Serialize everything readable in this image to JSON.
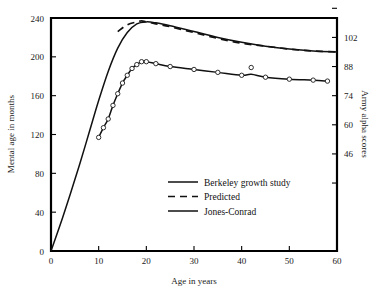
{
  "chart_data": {
    "type": "line",
    "title": "",
    "xlabel": "Age in years",
    "ylabel": "Mental age in months",
    "y2label": "Army alpha scores",
    "xlim": [
      0,
      60
    ],
    "ylim": [
      0,
      240
    ],
    "y2lim": [
      46,
      102
    ],
    "grid": false,
    "legend_position": "center",
    "xticks": [
      0,
      10,
      20,
      30,
      40,
      50,
      60
    ],
    "xtick_labels": [
      "0",
      "10",
      "20",
      "30",
      "40",
      "50",
      "60"
    ],
    "yticks": [
      0,
      40,
      80,
      120,
      160,
      200,
      240
    ],
    "ytick_labels": [
      "0",
      "40",
      "80",
      "120",
      "160",
      "200",
      "240"
    ],
    "y2ticks": [
      46,
      60,
      74,
      88,
      102
    ],
    "y2tick_labels": [
      "46",
      "60",
      "74",
      "88",
      "102"
    ],
    "y2tick_months": [
      100,
      130,
      160,
      190,
      220
    ],
    "series": [
      {
        "name": "Berkeley growth study",
        "style": "solid",
        "marker": "none",
        "x": [
          0,
          2,
          4,
          6,
          8,
          10,
          12,
          14,
          16,
          18,
          20,
          22,
          25,
          30,
          35,
          40,
          45,
          50,
          55,
          60
        ],
        "y": [
          0,
          28,
          58,
          89,
          122,
          155,
          185,
          209,
          225,
          234,
          236,
          235,
          232,
          226,
          220,
          215,
          211,
          208,
          206,
          205
        ]
      },
      {
        "name": "Predicted",
        "style": "dashed",
        "marker": "none",
        "x": [
          14,
          16,
          18,
          19,
          20,
          22,
          25,
          30,
          35,
          40,
          45,
          50,
          55,
          60
        ],
        "y": [
          226,
          233,
          236,
          237,
          236,
          234,
          231,
          225,
          219,
          214,
          211,
          208,
          206,
          205
        ]
      },
      {
        "name": "Jones-Conrad",
        "style": "solid",
        "marker": "circle",
        "x": [
          10,
          11,
          12,
          13,
          14,
          15,
          16,
          17,
          18,
          19,
          20,
          22,
          25,
          30,
          35,
          40,
          42,
          45,
          50,
          55,
          58
        ],
        "y": [
          117,
          127,
          136,
          150,
          162,
          173,
          181,
          188,
          192,
          195,
          195,
          193,
          190,
          187,
          184,
          181,
          182,
          179,
          177,
          176,
          175
        ]
      }
    ],
    "data_points": [
      {
        "age": 10,
        "mental_age": 117
      },
      {
        "age": 11,
        "mental_age": 127
      },
      {
        "age": 12,
        "mental_age": 136
      },
      {
        "age": 13,
        "mental_age": 150
      },
      {
        "age": 14,
        "mental_age": 162
      },
      {
        "age": 15,
        "mental_age": 173
      },
      {
        "age": 16,
        "mental_age": 181
      },
      {
        "age": 17,
        "mental_age": 188
      },
      {
        "age": 18,
        "mental_age": 192
      },
      {
        "age": 19,
        "mental_age": 195
      },
      {
        "age": 20,
        "mental_age": 195
      },
      {
        "age": 22,
        "mental_age": 193
      },
      {
        "age": 25,
        "mental_age": 190
      },
      {
        "age": 30,
        "mental_age": 187
      },
      {
        "age": 35,
        "mental_age": 184
      },
      {
        "age": 40,
        "mental_age": 181
      },
      {
        "age": 42,
        "mental_age": 189
      },
      {
        "age": 45,
        "mental_age": 179
      },
      {
        "age": 50,
        "mental_age": 177
      },
      {
        "age": 55,
        "mental_age": 176
      },
      {
        "age": 58,
        "mental_age": 175
      }
    ]
  },
  "legend": {
    "entries": [
      {
        "label": "Berkeley growth study",
        "style": "solid"
      },
      {
        "label": "Predicted",
        "style": "dashed"
      },
      {
        "label": "Jones-Conrad",
        "style": "solid"
      }
    ]
  }
}
